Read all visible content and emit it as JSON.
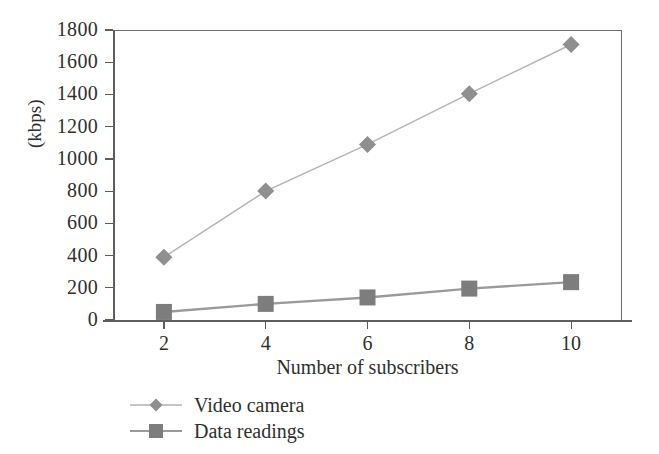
{
  "chart_data": {
    "type": "line",
    "title": "",
    "xlabel": "Number of subscribers",
    "ylabel": "(kbps)",
    "x": [
      2,
      4,
      6,
      8,
      10
    ],
    "xtick_labels": [
      "2",
      "4",
      "6",
      "8",
      "10"
    ],
    "xlim": [
      1,
      11
    ],
    "ylim": [
      0,
      1800
    ],
    "ytick_labels": [
      "0",
      "200",
      "400",
      "600",
      "800",
      "1000",
      "1200",
      "1400",
      "1600",
      "1800"
    ],
    "yticks": [
      0,
      200,
      400,
      600,
      800,
      1000,
      1200,
      1400,
      1600,
      1800
    ],
    "grid": false,
    "legend_position": "bottom-left",
    "series": [
      {
        "name": "Video camera",
        "marker": "diamond",
        "color": "#8f8f8f",
        "line_color": "#b3b3b3",
        "values": [
          390,
          800,
          1090,
          1405,
          1710
        ]
      },
      {
        "name": "Data readings",
        "marker": "square",
        "color": "#7d7d7d",
        "line_color": "#9a9a9a",
        "values": [
          50,
          100,
          140,
          195,
          235
        ]
      }
    ]
  },
  "axes": {
    "y_title": "(kbps)",
    "x_title": "Number of subscribers"
  },
  "legend": {
    "items": [
      {
        "label": "Video camera",
        "marker": "diamond-marker"
      },
      {
        "label": "Data readings",
        "marker": "square-marker"
      }
    ]
  },
  "colors": {
    "axis": "#5d5d5d",
    "frame": "#6e6e6e",
    "text": "#2f2f2f",
    "series_1": "#8f8f8f",
    "series_2": "#7d7d7d",
    "background": "#ffffff"
  }
}
